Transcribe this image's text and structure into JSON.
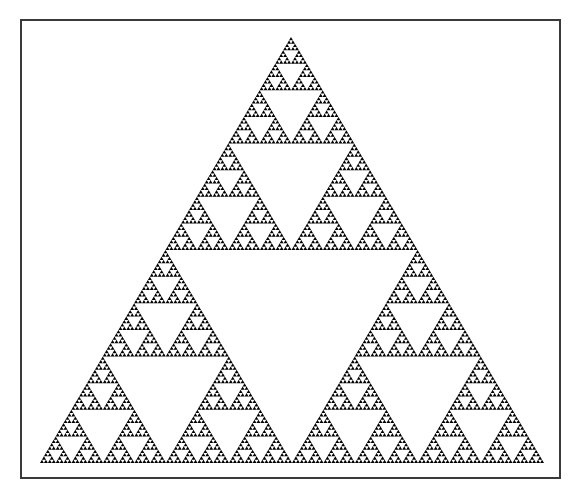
{
  "figure": {
    "title": "",
    "type": "sierpinski-triangle",
    "depth": 6,
    "fill_color": "#000000",
    "background_color": "#ffffff",
    "frame_color": "#3a3a3a",
    "vertices": {
      "apex": [
        291,
        37
      ],
      "base_left": [
        40,
        463
      ],
      "base_right": [
        544,
        463
      ]
    }
  }
}
